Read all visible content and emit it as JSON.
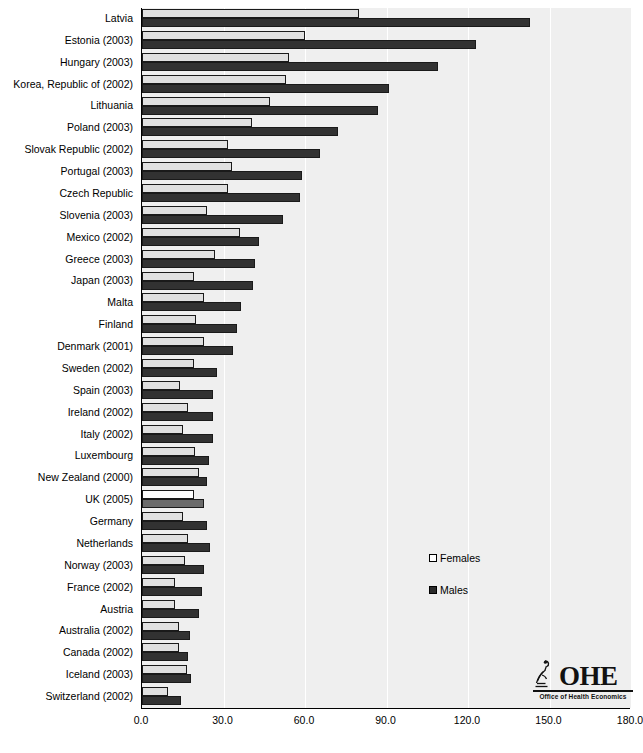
{
  "chart_data": {
    "type": "bar",
    "orientation": "horizontal",
    "title": "",
    "xlabel": "",
    "ylabel": "",
    "xlim": [
      0,
      180
    ],
    "xticks": [
      0.0,
      30.0,
      60.0,
      90.0,
      120.0,
      150.0,
      180.0
    ],
    "xtick_labels": [
      "0.0",
      "30.0",
      "60.0",
      "90.0",
      "120.0",
      "150.0",
      "180.0"
    ],
    "grid": true,
    "grid_axis": "x",
    "legend": {
      "position": "middle-right",
      "entries": [
        {
          "name": "Females",
          "color": "#ffffff",
          "swatch": "open-square"
        },
        {
          "name": "Males",
          "color": "#2a2a2a",
          "swatch": "filled-square"
        }
      ]
    },
    "categories": [
      "Latvia",
      "Estonia (2003)",
      "Hungary (2003)",
      "Korea, Republic of (2002)",
      "Lithuania",
      "Poland (2003)",
      "Slovak Republic (2002)",
      "Portugal (2003)",
      "Czech Republic",
      "Slovenia (2003)",
      "Mexico (2002)",
      "Greece (2003)",
      "Japan (2003)",
      "Malta",
      "Finland",
      "Denmark (2001)",
      "Sweden (2002)",
      "Spain (2003)",
      "Ireland (2002)",
      "Italy (2002)",
      "Luxembourg",
      "New Zealand (2000)",
      "UK (2005)",
      "Germany",
      "Netherlands",
      "Norway (2003)",
      "France (2002)",
      "Austria",
      "Australia (2002)",
      "Canada (2002)",
      "Iceland (2003)",
      "Switzerland (2002)"
    ],
    "series": [
      {
        "name": "Females",
        "values": [
          80.0,
          60.0,
          54.0,
          53.0,
          47.0,
          40.5,
          31.5,
          33.0,
          31.5,
          24.0,
          36.0,
          27.0,
          19.0,
          23.0,
          20.0,
          23.0,
          19.0,
          14.0,
          17.0,
          15.0,
          19.5,
          21.0,
          19.0,
          15.0,
          17.0,
          16.0,
          12.0,
          12.0,
          13.5,
          13.5,
          16.5,
          9.5
        ]
      },
      {
        "name": "Males",
        "values": [
          143.0,
          123.0,
          109.0,
          91.0,
          87.0,
          72.0,
          65.5,
          59.0,
          58.0,
          52.0,
          43.0,
          41.5,
          41.0,
          36.5,
          35.0,
          33.5,
          27.5,
          26.0,
          26.0,
          26.0,
          24.5,
          24.0,
          23.0,
          24.0,
          25.0,
          23.0,
          22.0,
          21.0,
          17.5,
          17.0,
          18.0,
          14.5
        ]
      }
    ],
    "highlight_category": "UK (2005)"
  },
  "legend": {
    "females_label": "Females",
    "males_label": "Males"
  },
  "logo": {
    "text": "OHE",
    "subtitle": "Office of Health Economics",
    "mark": "microscope-icon"
  }
}
